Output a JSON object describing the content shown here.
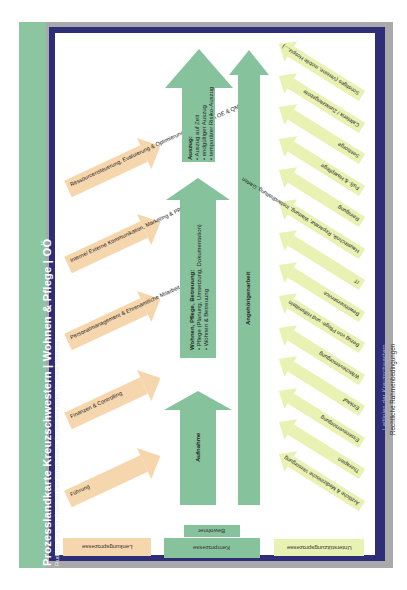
{
  "header": {
    "title": "Prozesslandkarte Kreuzschwestern | Wohnen & Pflege | OÖ",
    "subtitle": "Rudigier Linz, St. Raphael Bad Schallerbach, Bruderliebe Wels, St. Josef Sierning"
  },
  "frame": {
    "guidelines_label": "Leitlinien der Kreuzschwestern",
    "legal_label": "Rechtliche Rahmenbedingungen"
  },
  "colors": {
    "management": "#f6d7ad",
    "core": "#86c39c",
    "support": "#e9f1b3",
    "navy": "#2d2d78",
    "grey": "#a9a9ab",
    "title_strip": "#8cc6a0"
  },
  "management_processes": {
    "label": "Lenkungsprozesse",
    "items": [
      {
        "label": "Ressourcensteuerung, Evaluierung & Optimierung (im Sinne von OE & QM)"
      },
      {
        "label": "Interne/ Externe Kommunikation, Marketing & PR"
      },
      {
        "label": "Personalmanagement & Ehrenamtliche Mitarbeit"
      },
      {
        "label": "Finanzen & Controlling"
      },
      {
        "label": "Führung"
      }
    ]
  },
  "core_processes": {
    "label": "Kernprozesse",
    "base_label": "Bewohner",
    "steps": [
      {
        "title": "Auszug:",
        "bullets": [
          "Auszug auf Zeit",
          "endgültiger Auszug",
          "temporärer Risiko-Auszug"
        ]
      },
      {
        "title": "Wohnen, Pflege, Betreuung:",
        "bullets": [
          "Pflege (Planung, Umsetzung, Dokumentation)",
          "Wohnen & Betreuung"
        ]
      },
      {
        "title": "Aufnahme",
        "bullets": []
      }
    ],
    "relatives": "Angehörigenarbeit"
  },
  "support_processes": {
    "label": "Unterstützungsprozesse",
    "items": [
      {
        "label": "Sonstiges (Vereine, mobile Hospiz,...)"
      },
      {
        "label": "Cafeteria / Zusatzangebote"
      },
      {
        "label": "Seelsorge"
      },
      {
        "label": "Fuß- & Haarpflege"
      },
      {
        "label": "Reinigung"
      },
      {
        "label": "Haustechnik, Reparatur, Wartung, Instandhaltung, Garten"
      },
      {
        "label": "IT"
      },
      {
        "label": "Bewohnerservice"
      },
      {
        "label": "Bezug von Pflege- und Hilfsmitteln"
      },
      {
        "label": "Wäscheversorgung"
      },
      {
        "label": "Einkauf"
      },
      {
        "label": "Essensversorgung"
      },
      {
        "label": "Therapien"
      },
      {
        "label": "Ärztliche & Medizinische Versorgung"
      }
    ]
  }
}
